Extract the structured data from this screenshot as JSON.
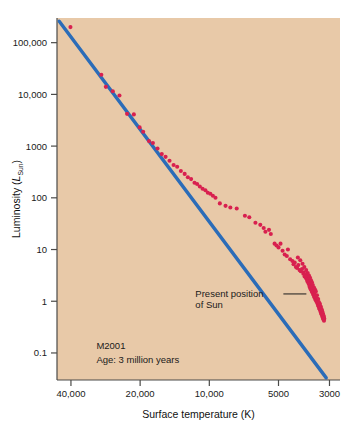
{
  "figure": {
    "background_color": "#ffffff",
    "plot_background_color": "#e8c9a8",
    "line_color": "#2b6cb8",
    "point_color": "#d8204f",
    "axis_color": "#4a4a48"
  },
  "axes": {
    "y_title_main": "Luminosity (",
    "y_title_symbol": "L",
    "y_title_sub": "Sun",
    "y_title_close": ")",
    "x_title": "Surface temperature (K)",
    "y_ticks": [
      "100,000",
      "10,000",
      "1000",
      "100",
      "10",
      "1",
      "0.1"
    ],
    "x_ticks": [
      "40,000",
      "20,000",
      "10,000",
      "5000",
      "3000"
    ]
  },
  "annotations": {
    "sun_label_line1": "Present position",
    "sun_label_line2": "of Sun",
    "cluster_name": "M2001",
    "cluster_age": "Age: 3 million years"
  },
  "chart_data": {
    "type": "scatter",
    "title": "",
    "xlabel": "Surface temperature (K)",
    "ylabel": "Luminosity (L_Sun)",
    "xscale": "log-reversed",
    "yscale": "log",
    "xlim": [
      46000,
      2700
    ],
    "ylim": [
      0.03,
      300000
    ],
    "xtick_values": [
      40000,
      20000,
      10000,
      5000,
      3000
    ],
    "ytick_values": [
      100000,
      10000,
      1000,
      100,
      10,
      1,
      0.1
    ],
    "grid": false,
    "legend": null,
    "series": [
      {
        "name": "Main sequence (zero-age)",
        "type": "line",
        "color": "#2b6cb8",
        "points": [
          {
            "x": 45000,
            "y": 260000
          },
          {
            "x": 3100,
            "y": 0.033
          }
        ]
      },
      {
        "name": "M2001 cluster stars",
        "type": "scatter",
        "color": "#d8204f",
        "points": [
          {
            "x": 40200,
            "y": 200000
          },
          {
            "x": 29500,
            "y": 24000
          },
          {
            "x": 28200,
            "y": 14000
          },
          {
            "x": 26300,
            "y": 11500
          },
          {
            "x": 24600,
            "y": 9500
          },
          {
            "x": 22800,
            "y": 4200
          },
          {
            "x": 21300,
            "y": 4100
          },
          {
            "x": 20100,
            "y": 2300
          },
          {
            "x": 19400,
            "y": 1900
          },
          {
            "x": 18300,
            "y": 1250
          },
          {
            "x": 17600,
            "y": 1150
          },
          {
            "x": 16800,
            "y": 900
          },
          {
            "x": 16100,
            "y": 700
          },
          {
            "x": 15500,
            "y": 620
          },
          {
            "x": 14900,
            "y": 520
          },
          {
            "x": 14300,
            "y": 430
          },
          {
            "x": 13800,
            "y": 400
          },
          {
            "x": 13300,
            "y": 330
          },
          {
            "x": 12800,
            "y": 290
          },
          {
            "x": 12400,
            "y": 250
          },
          {
            "x": 12000,
            "y": 230
          },
          {
            "x": 11600,
            "y": 195
          },
          {
            "x": 11300,
            "y": 185
          },
          {
            "x": 11000,
            "y": 165
          },
          {
            "x": 10700,
            "y": 150
          },
          {
            "x": 10400,
            "y": 140
          },
          {
            "x": 10150,
            "y": 125
          },
          {
            "x": 9900,
            "y": 120
          },
          {
            "x": 9650,
            "y": 110
          },
          {
            "x": 9400,
            "y": 100
          },
          {
            "x": 9000,
            "y": 78
          },
          {
            "x": 8500,
            "y": 70
          },
          {
            "x": 8100,
            "y": 65
          },
          {
            "x": 7600,
            "y": 62
          },
          {
            "x": 7000,
            "y": 45
          },
          {
            "x": 6700,
            "y": 42
          },
          {
            "x": 6300,
            "y": 33
          },
          {
            "x": 6000,
            "y": 30
          },
          {
            "x": 5800,
            "y": 26
          },
          {
            "x": 5700,
            "y": 22
          },
          {
            "x": 5500,
            "y": 24
          },
          {
            "x": 5400,
            "y": 20
          },
          {
            "x": 5200,
            "y": 13
          },
          {
            "x": 5100,
            "y": 12
          },
          {
            "x": 5000,
            "y": 11
          },
          {
            "x": 4900,
            "y": 13
          },
          {
            "x": 4800,
            "y": 9.5
          },
          {
            "x": 4700,
            "y": 8
          },
          {
            "x": 4600,
            "y": 7.5
          },
          {
            "x": 4550,
            "y": 10
          },
          {
            "x": 4450,
            "y": 6.5
          },
          {
            "x": 4350,
            "y": 6
          },
          {
            "x": 4300,
            "y": 5.2
          },
          {
            "x": 4250,
            "y": 5.6
          },
          {
            "x": 4200,
            "y": 4.6
          },
          {
            "x": 4150,
            "y": 4.4
          },
          {
            "x": 4100,
            "y": 5.0
          },
          {
            "x": 4050,
            "y": 4.0
          },
          {
            "x": 4000,
            "y": 3.8
          },
          {
            "x": 3950,
            "y": 4.2
          },
          {
            "x": 3900,
            "y": 3.4
          },
          {
            "x": 3880,
            "y": 3.6
          },
          {
            "x": 3850,
            "y": 3.0
          },
          {
            "x": 3820,
            "y": 3.2
          },
          {
            "x": 3800,
            "y": 2.8
          },
          {
            "x": 3780,
            "y": 3.0
          },
          {
            "x": 3760,
            "y": 2.6
          },
          {
            "x": 3740,
            "y": 2.4
          },
          {
            "x": 3720,
            "y": 2.7
          },
          {
            "x": 3700,
            "y": 2.2
          },
          {
            "x": 3690,
            "y": 2.45
          },
          {
            "x": 3670,
            "y": 2.0
          },
          {
            "x": 3660,
            "y": 2.2
          },
          {
            "x": 3650,
            "y": 1.85
          },
          {
            "x": 3630,
            "y": 2.0
          },
          {
            "x": 3620,
            "y": 1.7
          },
          {
            "x": 3600,
            "y": 1.9
          },
          {
            "x": 3590,
            "y": 1.6
          },
          {
            "x": 3580,
            "y": 1.75
          },
          {
            "x": 3565,
            "y": 1.5
          },
          {
            "x": 3550,
            "y": 1.65
          },
          {
            "x": 3540,
            "y": 1.4
          },
          {
            "x": 3530,
            "y": 1.55
          },
          {
            "x": 3515,
            "y": 1.3
          },
          {
            "x": 3500,
            "y": 1.45
          },
          {
            "x": 3490,
            "y": 1.2
          },
          {
            "x": 3480,
            "y": 1.35
          },
          {
            "x": 3465,
            "y": 1.12
          },
          {
            "x": 3450,
            "y": 1.25
          },
          {
            "x": 3440,
            "y": 1.05
          },
          {
            "x": 3430,
            "y": 1.18
          },
          {
            "x": 3415,
            "y": 0.98
          },
          {
            "x": 3400,
            "y": 1.1
          },
          {
            "x": 3390,
            "y": 0.92
          },
          {
            "x": 3380,
            "y": 1.02
          },
          {
            "x": 3370,
            "y": 0.86
          },
          {
            "x": 3360,
            "y": 0.95
          },
          {
            "x": 3350,
            "y": 0.8
          },
          {
            "x": 3340,
            "y": 0.88
          },
          {
            "x": 3330,
            "y": 0.74
          },
          {
            "x": 3320,
            "y": 0.82
          },
          {
            "x": 3310,
            "y": 0.7
          },
          {
            "x": 3300,
            "y": 0.77
          },
          {
            "x": 3290,
            "y": 0.65
          },
          {
            "x": 3280,
            "y": 0.72
          },
          {
            "x": 3270,
            "y": 0.6
          },
          {
            "x": 3260,
            "y": 0.66
          },
          {
            "x": 3250,
            "y": 0.56
          },
          {
            "x": 3240,
            "y": 0.62
          },
          {
            "x": 3230,
            "y": 0.52
          },
          {
            "x": 3220,
            "y": 0.58
          },
          {
            "x": 3210,
            "y": 0.48
          },
          {
            "x": 3200,
            "y": 0.54
          },
          {
            "x": 3190,
            "y": 0.45
          },
          {
            "x": 3180,
            "y": 0.5
          },
          {
            "x": 3170,
            "y": 0.42
          },
          {
            "x": 3160,
            "y": 0.46
          },
          {
            "x": 3440,
            "y": 1.55
          },
          {
            "x": 3470,
            "y": 1.68
          },
          {
            "x": 3505,
            "y": 1.85
          },
          {
            "x": 3545,
            "y": 2.05
          },
          {
            "x": 3575,
            "y": 2.3
          },
          {
            "x": 3610,
            "y": 2.55
          },
          {
            "x": 3645,
            "y": 2.85
          },
          {
            "x": 3685,
            "y": 3.15
          },
          {
            "x": 3730,
            "y": 3.5
          },
          {
            "x": 3790,
            "y": 4.0
          },
          {
            "x": 3860,
            "y": 4.6
          },
          {
            "x": 3930,
            "y": 5.3
          },
          {
            "x": 4020,
            "y": 6.2
          },
          {
            "x": 4120,
            "y": 7.0
          },
          {
            "x": 3400,
            "y": 1.3
          },
          {
            "x": 3360,
            "y": 1.1
          },
          {
            "x": 3330,
            "y": 0.95
          },
          {
            "x": 3300,
            "y": 0.88
          },
          {
            "x": 3270,
            "y": 0.78
          },
          {
            "x": 3245,
            "y": 0.7
          },
          {
            "x": 3225,
            "y": 0.64
          },
          {
            "x": 3205,
            "y": 0.58
          },
          {
            "x": 3185,
            "y": 0.53
          },
          {
            "x": 3175,
            "y": 0.49
          }
        ]
      }
    ],
    "annotations": [
      {
        "text": "Present position of Sun",
        "x": 11500,
        "y": 1.2
      },
      {
        "text": "M2001",
        "x": 31000,
        "y": 0.12
      },
      {
        "text": "Age: 3 million years",
        "x": 31000,
        "y": 0.065
      }
    ]
  }
}
